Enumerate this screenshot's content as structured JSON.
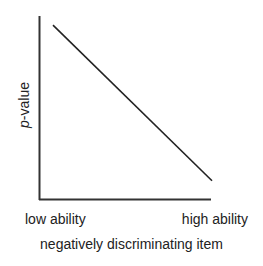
{
  "chart_data": {
    "type": "line",
    "title": "negatively discriminating item",
    "xlabel": "",
    "ylabel": "p-value",
    "ylabel_italic_part": "p",
    "ylabel_rest": "-value",
    "x_tick_labels": [
      "low ability",
      "high ability"
    ],
    "series": [
      {
        "name": "item characteristic",
        "x": [
          0.0,
          1.0
        ],
        "y": [
          0.95,
          0.1
        ]
      }
    ],
    "xlim": [
      0,
      1
    ],
    "ylim": [
      0,
      1
    ],
    "grid": false,
    "legend": null,
    "line_color": "#222222"
  }
}
